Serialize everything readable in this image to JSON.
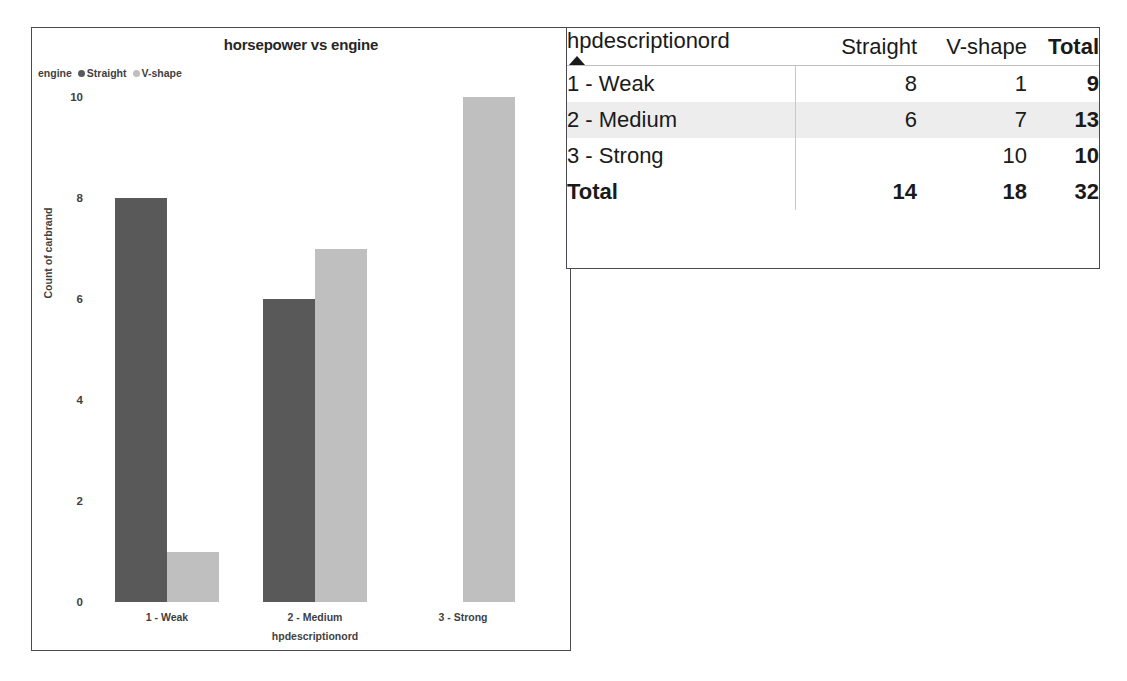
{
  "chart": {
    "title": "horsepower vs engine",
    "legend": {
      "field_label": "engine",
      "items": [
        {
          "label": "Straight",
          "color": "#595959"
        },
        {
          "label": "V-shape",
          "color": "#bfbfbf"
        }
      ]
    },
    "y_axis_title": "Count of carbrand",
    "x_axis_title": "hpdescriptionord",
    "y_ticks": [
      "0",
      "2",
      "4",
      "6",
      "8",
      "10"
    ]
  },
  "chart_data": {
    "type": "bar",
    "title": "horsepower vs engine",
    "xlabel": "hpdescriptionord",
    "ylabel": "Count of carbrand",
    "categories": [
      "1 - Weak",
      "2 - Medium",
      "3 - Strong"
    ],
    "series": [
      {
        "name": "Straight",
        "color": "#595959",
        "values": [
          8,
          6,
          0
        ]
      },
      {
        "name": "V-shape",
        "color": "#bfbfbf",
        "values": [
          1,
          7,
          10
        ]
      }
    ],
    "ylim": [
      0,
      10
    ],
    "yticks": [
      0,
      2,
      4,
      6,
      8,
      10
    ],
    "grid": false,
    "legend_position": "top-left",
    "grouping": "grouped"
  },
  "table": {
    "row_field_header": "hpdescriptionord",
    "sort_indicator": "ascending",
    "columns": [
      {
        "label": "Straight",
        "bold": false
      },
      {
        "label": "V-shape",
        "bold": false
      },
      {
        "label": "Total",
        "bold": true
      }
    ],
    "rows": [
      {
        "label": "1 - Weak",
        "straight": "8",
        "vshape": "1",
        "total": "9",
        "highlight": false
      },
      {
        "label": "2 - Medium",
        "straight": "6",
        "vshape": "7",
        "total": "13",
        "highlight": true
      },
      {
        "label": "3 - Strong",
        "straight": "",
        "vshape": "10",
        "total": "10",
        "highlight": false
      }
    ],
    "total_row": {
      "label": "Total",
      "straight": "14",
      "vshape": "18",
      "total": "32"
    }
  }
}
